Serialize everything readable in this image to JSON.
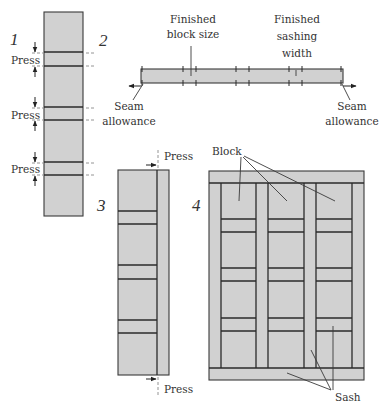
{
  "figure": {
    "fill_color": "#d1d1d1",
    "line_color": "#3a3a3a"
  },
  "steps": [
    {
      "number": "1",
      "labels": {
        "press_1": "Press",
        "press_2": "Press",
        "press_3": "Press"
      }
    },
    {
      "number": "2",
      "labels": {
        "finished_block_1": "Finished",
        "finished_block_2": "block size",
        "finished_sash_1": "Finished",
        "finished_sash_2": "sashing",
        "finished_sash_3": "width",
        "seam_left_1": "Seam",
        "seam_left_2": "allowance",
        "seam_right_1": "Seam",
        "seam_right_2": "allowance"
      }
    },
    {
      "number": "3",
      "labels": {
        "press_top": "Press",
        "press_bottom": "Press"
      }
    },
    {
      "number": "4",
      "labels": {
        "block": "Block",
        "sash": "Sash"
      }
    }
  ]
}
